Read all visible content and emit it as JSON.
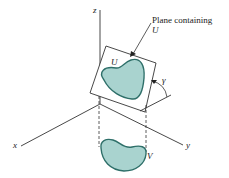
{
  "figure": {
    "labels": {
      "z_axis": "z",
      "x_axis": "x",
      "y_axis": "y",
      "plane_caption_line1": "Plane containing",
      "plane_caption_line2": "U",
      "region_u": "U",
      "region_v": "V",
      "angle": "γ"
    },
    "colors": {
      "fill": "#a9d3cf",
      "outline": "#2e6f69",
      "line": "#333333"
    }
  }
}
